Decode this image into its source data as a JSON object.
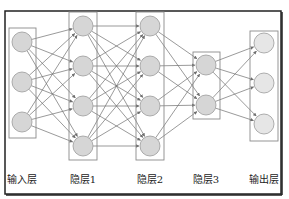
{
  "diagram": {
    "type": "feedforward-neural-network",
    "frame": {
      "x": 5,
      "y": 11,
      "w": 276,
      "h": 183
    },
    "colors": {
      "frame": "#222222",
      "box": "#8a8a8a",
      "edge": "#6e6e6e",
      "node_fill": "#d6d6d6",
      "node_stroke": "#9a9a9a",
      "output_fill": "#e6e6e6"
    },
    "layers": [
      {
        "id": "input",
        "label": "输入层",
        "box": {
          "x": 9,
          "y": 28,
          "w": 27,
          "h": 110
        },
        "cx": 22,
        "nodes": [
          42,
          82,
          122
        ]
      },
      {
        "id": "hidden1",
        "label": "隐层1",
        "box": {
          "x": 69,
          "y": 12,
          "w": 28,
          "h": 148
        },
        "cx": 83,
        "nodes": [
          26,
          66,
          106,
          146
        ]
      },
      {
        "id": "hidden2",
        "label": "隐层2",
        "box": {
          "x": 136,
          "y": 12,
          "w": 28,
          "h": 148
        },
        "cx": 150,
        "nodes": [
          26,
          66,
          106,
          146
        ]
      },
      {
        "id": "hidden3",
        "label": "隐层3",
        "box": {
          "x": 193,
          "y": 52,
          "w": 27,
          "h": 67
        },
        "cx": 206,
        "nodes": [
          65,
          105
        ]
      },
      {
        "id": "output",
        "label": "输出层",
        "box": {
          "x": 250,
          "y": 31,
          "w": 28,
          "h": 110
        },
        "cx": 264,
        "nodes": [
          43,
          83,
          124
        ]
      }
    ],
    "node_radius": 10,
    "label_y": 183
  },
  "labels": {
    "input": "输入层",
    "hidden1": "隐层1",
    "hidden2": "隐层2",
    "hidden3": "隐层3",
    "output": "输出层"
  }
}
